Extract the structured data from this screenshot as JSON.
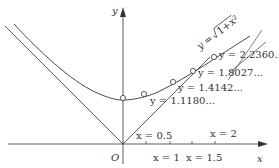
{
  "diagram": {
    "axes": {
      "x_label": "x",
      "y_label": "y",
      "origin_label": "O"
    },
    "curve_label": "y = √(1+x²)",
    "curve_label_parts": {
      "prefix": "y =",
      "radicand": "1+x²"
    },
    "points": [
      {
        "x": 0,
        "y_label": ""
      },
      {
        "x": 0.5,
        "y_label": "y = 1.1180..."
      },
      {
        "x": 1,
        "y_label": "y = 1.4142..."
      },
      {
        "x": 1.5,
        "y_label": "y = 1.8027..."
      },
      {
        "x": 2,
        "y_label": "y = 2.2360..."
      }
    ],
    "x_ticks": [
      {
        "value": 0.5,
        "label": "x = 0.5"
      },
      {
        "value": 1,
        "label": "x = 1"
      },
      {
        "value": 1.5,
        "label": "x = 1.5"
      },
      {
        "value": 2,
        "label": "x = 2"
      }
    ],
    "asymptotes": "y = |x|",
    "colors": {
      "line": "#333333",
      "background": "#ffffff"
    }
  }
}
